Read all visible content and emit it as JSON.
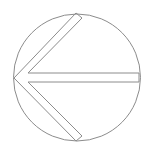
{
  "icon": {
    "name": "left-arrow-in-circle",
    "direction": "left",
    "stroke_color": "#8c8c8c",
    "background": "#ffffff"
  }
}
